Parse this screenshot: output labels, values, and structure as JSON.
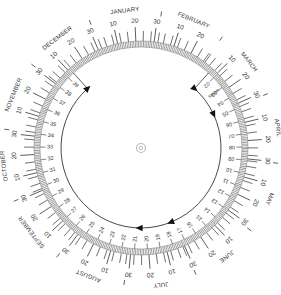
{
  "wheel": {
    "title": "Calendar due-date wheel",
    "center_mark": "target-icon",
    "months": [
      "JANUARY",
      "FEBRUARY",
      "MARCH",
      "APRIL",
      "MAY",
      "JUNE",
      "JULY",
      "AUGUST",
      "SEPTEMBER",
      "OCTOBER",
      "NOVEMBER",
      "DECEMBER"
    ],
    "month_days": [
      31,
      28,
      31,
      30,
      31,
      30,
      31,
      31,
      30,
      31,
      30,
      31
    ],
    "day_labels": [
      "10",
      "20",
      "30"
    ],
    "weeks_label": "weeks",
    "week_numbers": [
      "02",
      "03",
      "04",
      "05",
      "06",
      "07",
      "08",
      "09",
      "10",
      "11",
      "12",
      "13",
      "14",
      "15",
      "16",
      "17",
      "18",
      "19",
      "20",
      "21",
      "22",
      "23",
      "24",
      "25",
      "26",
      "27",
      "28",
      "29",
      "30",
      "31",
      "32",
      "33",
      "34",
      "35",
      "36",
      "37",
      "38",
      "39"
    ],
    "markers": [
      "start-arrow",
      "week-13-arrow",
      "week-27-arrow",
      "due-arrow"
    ],
    "colors": {
      "ink": "#333333",
      "band": "#777777",
      "background": "#ffffff"
    }
  }
}
